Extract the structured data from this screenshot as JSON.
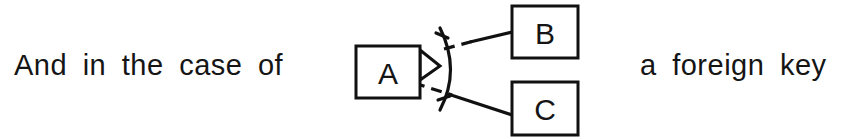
{
  "page": {
    "background_color": "#ffffff",
    "ink_color": "#111111",
    "width": 858,
    "height": 139
  },
  "sentence": {
    "left_text": "And in the case of",
    "right_text": "a foreign key"
  },
  "diagram": {
    "type": "entity-relationship",
    "notation": "arrow-and-arc",
    "entities": [
      {
        "id": "A",
        "label": "A",
        "role": "source",
        "x": 16,
        "y": 46,
        "width": 64,
        "height": 52
      },
      {
        "id": "B",
        "label": "B",
        "role": "target",
        "x": 172,
        "y": 6,
        "width": 66,
        "height": 52
      },
      {
        "id": "C",
        "label": "C",
        "role": "target",
        "x": 172,
        "y": 82,
        "width": 66,
        "height": 53
      }
    ],
    "connector": {
      "arrowhead_from": "A",
      "arc_label": "multiplicity-arc",
      "links": [
        {
          "from": "A",
          "to": "B",
          "style": "solid-with-dashed-gap"
        },
        {
          "from": "A",
          "to": "C",
          "style": "solid-with-dashed-gap"
        }
      ]
    }
  }
}
